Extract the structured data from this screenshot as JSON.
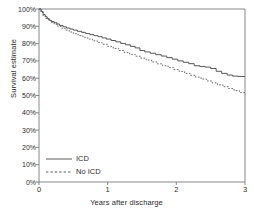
{
  "chart_data": {
    "type": "line",
    "title": "",
    "subtitle": "",
    "xlabel": "Years after discharge",
    "ylabel": "Survival estimate",
    "xlim": [
      0,
      3
    ],
    "ylim": [
      0,
      1
    ],
    "grid": false,
    "legend_position": "lower-left",
    "xticks": [
      0,
      1,
      2,
      3
    ],
    "xticklabels": [
      "0",
      "1",
      "2",
      "3"
    ],
    "yticks": [
      0,
      0.1,
      0.2,
      0.3,
      0.4,
      0.5,
      0.6,
      0.7,
      0.8,
      0.9,
      1.0
    ],
    "yticklabels": [
      "0%",
      "10%",
      "20%",
      "30%",
      "40%",
      "50%",
      "60%",
      "70%",
      "80%",
      "90%",
      "100%"
    ],
    "series": [
      {
        "name": "ICD",
        "style": "solid",
        "color": "#444444",
        "x": [
          0.0,
          0.03,
          0.06,
          0.09,
          0.12,
          0.15,
          0.18,
          0.22,
          0.26,
          0.3,
          0.35,
          0.4,
          0.45,
          0.5,
          0.56,
          0.62,
          0.68,
          0.74,
          0.8,
          0.86,
          0.92,
          0.98,
          1.05,
          1.12,
          1.19,
          1.26,
          1.33,
          1.4,
          1.47,
          1.54,
          1.62,
          1.7,
          1.78,
          1.86,
          1.94,
          2.02,
          2.1,
          2.18,
          2.26,
          2.34,
          2.42,
          2.5,
          2.58,
          2.66,
          2.74,
          2.82,
          2.9,
          3.0
        ],
        "y": [
          1.0,
          0.985,
          0.968,
          0.955,
          0.944,
          0.935,
          0.928,
          0.921,
          0.913,
          0.905,
          0.897,
          0.89,
          0.884,
          0.878,
          0.871,
          0.865,
          0.858,
          0.852,
          0.846,
          0.84,
          0.833,
          0.826,
          0.818,
          0.81,
          0.801,
          0.793,
          0.784,
          0.775,
          0.76,
          0.752,
          0.744,
          0.736,
          0.728,
          0.719,
          0.71,
          0.7,
          0.692,
          0.684,
          0.672,
          0.668,
          0.664,
          0.656,
          0.64,
          0.628,
          0.618,
          0.612,
          0.61,
          0.61
        ]
      },
      {
        "name": "No ICD",
        "style": "dashed",
        "color": "#555555",
        "x": [
          0.0,
          0.03,
          0.06,
          0.1,
          0.14,
          0.18,
          0.22,
          0.27,
          0.32,
          0.38,
          0.44,
          0.5,
          0.57,
          0.64,
          0.71,
          0.78,
          0.85,
          0.92,
          1.0,
          1.08,
          1.16,
          1.24,
          1.32,
          1.4,
          1.48,
          1.56,
          1.64,
          1.72,
          1.8,
          1.88,
          1.96,
          2.04,
          2.12,
          2.2,
          2.28,
          2.36,
          2.44,
          2.52,
          2.6,
          2.68,
          2.76,
          2.84,
          2.92,
          3.0
        ],
        "y": [
          1.0,
          0.98,
          0.96,
          0.945,
          0.933,
          0.922,
          0.912,
          0.9,
          0.889,
          0.878,
          0.867,
          0.857,
          0.846,
          0.836,
          0.826,
          0.816,
          0.806,
          0.796,
          0.784,
          0.772,
          0.76,
          0.749,
          0.738,
          0.727,
          0.716,
          0.705,
          0.694,
          0.683,
          0.672,
          0.661,
          0.65,
          0.639,
          0.628,
          0.617,
          0.606,
          0.595,
          0.584,
          0.573,
          0.562,
          0.551,
          0.54,
          0.528,
          0.517,
          0.505
        ]
      }
    ],
    "legend": [
      {
        "label": "ICD",
        "style": "solid"
      },
      {
        "label": "No ICD",
        "style": "dashed"
      }
    ]
  }
}
